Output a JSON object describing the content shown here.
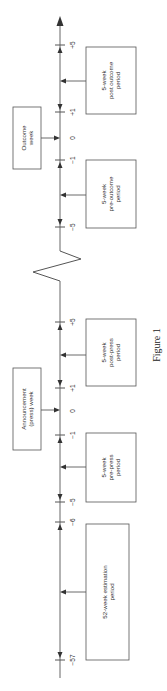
{
  "figure": {
    "caption": "Figure 1",
    "orientation": "rotated-90-ccw",
    "colors": {
      "line": "#555555",
      "text": "#333333",
      "background": "#ffffff"
    }
  },
  "boxes": {
    "estimation": {
      "line1": "52-week estimation",
      "line2": "period"
    },
    "pre_press": {
      "line1": "5-week",
      "line2": "pre-press",
      "line3": "period"
    },
    "announcement": {
      "line1": "Announcement",
      "line2": "(press) week"
    },
    "post_press": {
      "line1": "5-week",
      "line2": "post-press",
      "line3": "period"
    },
    "pre_outcome": {
      "line1": "5-week",
      "line2": "pre-outcome",
      "line3": "period"
    },
    "outcome": {
      "line1": "Outcome",
      "line2": "week"
    },
    "post_outcome": {
      "line1": "5-week",
      "line2": "post outcome",
      "line3": "period"
    }
  },
  "ticks": {
    "press": {
      "m57": "−57",
      "m6": "−6",
      "m5": "−5",
      "m1": "−1",
      "zero": "0",
      "p1": "+1",
      "p5": "+5"
    },
    "outcome": {
      "m5": "−5",
      "m1": "−1",
      "zero": "0",
      "p1": "+1",
      "p5": "+5"
    }
  }
}
